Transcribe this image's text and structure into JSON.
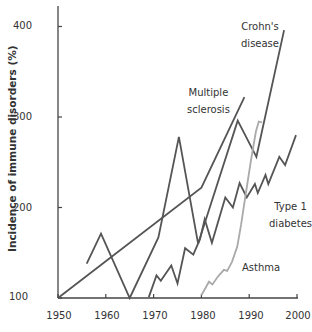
{
  "chart_data": {
    "type": "line",
    "title": "",
    "xlabel": "",
    "ylabel": "Incidence of immune disorders (%)",
    "xlim": [
      1950,
      2000
    ],
    "ylim": [
      100,
      420
    ],
    "grid": false,
    "legend_position": "inline labels",
    "x_ticks": [
      "1950",
      "1960",
      "1970",
      "1980",
      "1990",
      "2000"
    ],
    "y_ticks": [
      "100",
      "200",
      "300",
      "400"
    ],
    "series": [
      {
        "name": "Multiple sclerosis",
        "label_lines": [
          "Multiple",
          "sclerosis"
        ],
        "color": "#555555",
        "points": [
          [
            1950,
            100
          ],
          [
            1980,
            222
          ],
          [
            1989,
            322
          ]
        ]
      },
      {
        "name": "Crohn's disease",
        "label_lines": [
          "Crohn's",
          "disease"
        ],
        "color": "#555555",
        "points": [
          [
            1956,
            138
          ],
          [
            1959,
            171
          ],
          [
            1965,
            100
          ],
          [
            1971,
            167
          ],
          [
            1975.3,
            278
          ],
          [
            1979.3,
            160
          ],
          [
            1987.6,
            296
          ],
          [
            1991.5,
            256
          ],
          [
            1997.3,
            396
          ]
        ]
      },
      {
        "name": "Type 1 diabetes",
        "label_lines": [
          "Type 1",
          "diabetes"
        ],
        "color": "#555555",
        "points": [
          [
            1969,
            101
          ],
          [
            1970.6,
            125
          ],
          [
            1971.5,
            119
          ],
          [
            1973.7,
            136
          ],
          [
            1975,
            116
          ],
          [
            1976.6,
            155
          ],
          [
            1978.3,
            148
          ],
          [
            1979.7,
            165
          ],
          [
            1980.7,
            187
          ],
          [
            1982.2,
            161
          ],
          [
            1985,
            211
          ],
          [
            1986.6,
            200
          ],
          [
            1988,
            227
          ],
          [
            1989.5,
            211
          ],
          [
            1991.2,
            226
          ],
          [
            1991.8,
            216
          ],
          [
            1993.4,
            236
          ],
          [
            1994,
            226
          ],
          [
            1996.3,
            256
          ],
          [
            1997.5,
            247
          ],
          [
            1999.8,
            280
          ]
        ]
      },
      {
        "name": "Asthma",
        "label_lines": [
          "Asthma"
        ],
        "color": "#aaaaaa",
        "points": [
          [
            1980,
            103
          ],
          [
            1981.6,
            118
          ],
          [
            1982.3,
            115
          ],
          [
            1983.5,
            124
          ],
          [
            1984.7,
            131
          ],
          [
            1985.4,
            130
          ],
          [
            1986.4,
            140
          ],
          [
            1987.5,
            157
          ],
          [
            1988.3,
            181
          ],
          [
            1989.3,
            216
          ],
          [
            1990.4,
            253
          ],
          [
            1991.4,
            284
          ],
          [
            1992,
            295
          ],
          [
            1992.7,
            294
          ]
        ]
      }
    ]
  },
  "labels": {
    "ylabel": "Incidence of immune disorders (%)",
    "yticks": [
      "100",
      "200",
      "300",
      "400"
    ],
    "xticks": [
      "1950",
      "1960",
      "1970",
      "1980",
      "1990",
      "2000"
    ],
    "ms_line1": "Multiple",
    "ms_line2": "sclerosis",
    "crohns_line1": "Crohn's",
    "crohns_line2": "disease",
    "diabetes_line1": "Type 1",
    "diabetes_line2": "diabetes",
    "asthma": "Asthma"
  }
}
